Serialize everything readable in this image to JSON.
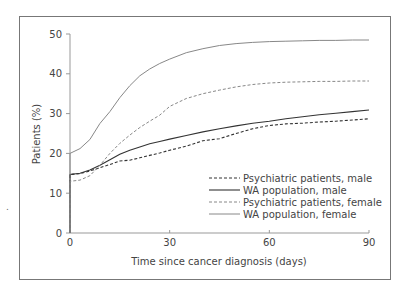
{
  "chart_data": {
    "type": "line",
    "title": "",
    "xlabel": "Time since cancer diagnosis (days)",
    "ylabel": "Patients (%)",
    "xlim": [
      0,
      90
    ],
    "ylim": [
      0,
      50
    ],
    "xticks": [
      0,
      30,
      60,
      90
    ],
    "yticks": [
      0,
      10,
      20,
      30,
      40,
      50
    ],
    "grid": false,
    "legend_position": "lower right (inside plot)",
    "x": [
      0,
      3,
      6,
      9,
      12,
      15,
      18,
      21,
      24,
      27,
      30,
      35,
      40,
      45,
      50,
      55,
      60,
      65,
      70,
      75,
      80,
      85,
      90
    ],
    "series": [
      {
        "name": "Psychiatric patients, male",
        "style": "dashed",
        "color": "#333333",
        "values": [
          14.7,
          14.9,
          15.6,
          16.4,
          17.2,
          18.1,
          18.3,
          18.9,
          19.5,
          20.1,
          20.8,
          21.8,
          23.2,
          23.7,
          25.0,
          26.2,
          27.0,
          27.4,
          27.6,
          27.9,
          28.1,
          28.4,
          28.7
        ]
      },
      {
        "name": "WA population, male",
        "style": "solid",
        "color": "#333333",
        "values": [
          14.7,
          15.0,
          15.8,
          17.0,
          18.4,
          19.8,
          20.8,
          21.6,
          22.4,
          23.0,
          23.6,
          24.5,
          25.4,
          26.2,
          26.9,
          27.6,
          28.1,
          28.7,
          29.2,
          29.7,
          30.1,
          30.5,
          30.9
        ]
      },
      {
        "name": "Psychiatric patients, female",
        "style": "dashed",
        "color": "#888888",
        "values": [
          13.0,
          13.3,
          14.4,
          17.0,
          20.0,
          22.5,
          24.6,
          26.5,
          28.1,
          29.6,
          31.8,
          33.8,
          35.0,
          35.9,
          36.7,
          37.3,
          37.7,
          37.9,
          38.0,
          38.1,
          38.1,
          38.2,
          38.2
        ]
      },
      {
        "name": "WA population, female",
        "style": "solid",
        "color": "#888888",
        "values": [
          20.0,
          21.2,
          23.5,
          27.5,
          30.5,
          34.0,
          37.0,
          39.5,
          41.2,
          42.6,
          43.7,
          45.3,
          46.3,
          47.1,
          47.6,
          47.9,
          48.1,
          48.2,
          48.3,
          48.4,
          48.4,
          48.5,
          48.5
        ]
      }
    ]
  },
  "axes": {
    "xlabel": "Time since cancer diagnosis (days)",
    "ylabel": "Patients (%)",
    "xtick_labels": [
      "0",
      "30",
      "60",
      "90"
    ],
    "ytick_labels": [
      "0",
      "10",
      "20",
      "30",
      "40",
      "50"
    ]
  },
  "legend": [
    {
      "label": "Psychiatric patients, male"
    },
    {
      "label": "WA population, male"
    },
    {
      "label": "Psychiatric patients, female"
    },
    {
      "label": "WA population, female"
    }
  ]
}
